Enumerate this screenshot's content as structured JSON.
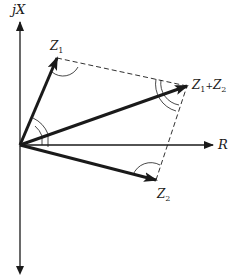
{
  "diagram": {
    "axes": {
      "imaginary_label": "jX",
      "real_label": "R"
    },
    "vectors": [
      {
        "name": "Z1",
        "label_main": "Z",
        "label_sub": "1"
      },
      {
        "name": "Z2",
        "label_main": "Z",
        "label_sub": "2"
      },
      {
        "name": "Z1+Z2",
        "label_main1": "Z",
        "label_sub1": "1",
        "label_plus": "+",
        "label_main2": "Z",
        "label_sub2": "2"
      }
    ],
    "colors": {
      "ink": "#1a1a1a",
      "background": "#ffffff"
    }
  }
}
